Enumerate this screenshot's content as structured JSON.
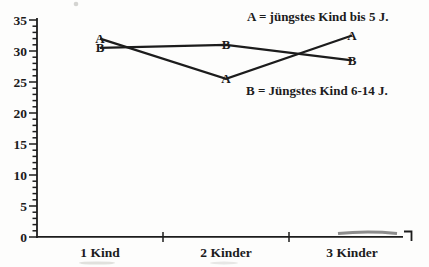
{
  "figure": {
    "background": "#fdfdfc",
    "ink": "#1c1c1c"
  },
  "chart_data": {
    "type": "line",
    "categories": [
      "1 Kind",
      "2 Kinder",
      "3 Kinder"
    ],
    "series": [
      {
        "name": "A",
        "marker": "A",
        "values": [
          32,
          25.5,
          32.5
        ]
      },
      {
        "name": "B",
        "marker": "B",
        "values": [
          30.5,
          31,
          28.5
        ]
      }
    ],
    "title": "",
    "xlabel": "",
    "ylabel": "",
    "ylim": [
      0,
      35
    ],
    "y_major_step": 5,
    "y_minor_step": 1,
    "y_tick_labels": [
      "0",
      "5",
      "10",
      "15",
      "20",
      "25",
      "30",
      "35"
    ],
    "grid": false,
    "legend_position": "inside-right",
    "legend": [
      "A = jüngstes Kind bis 5 J.",
      "B = Jüngstes Kind 6-14 J."
    ]
  }
}
